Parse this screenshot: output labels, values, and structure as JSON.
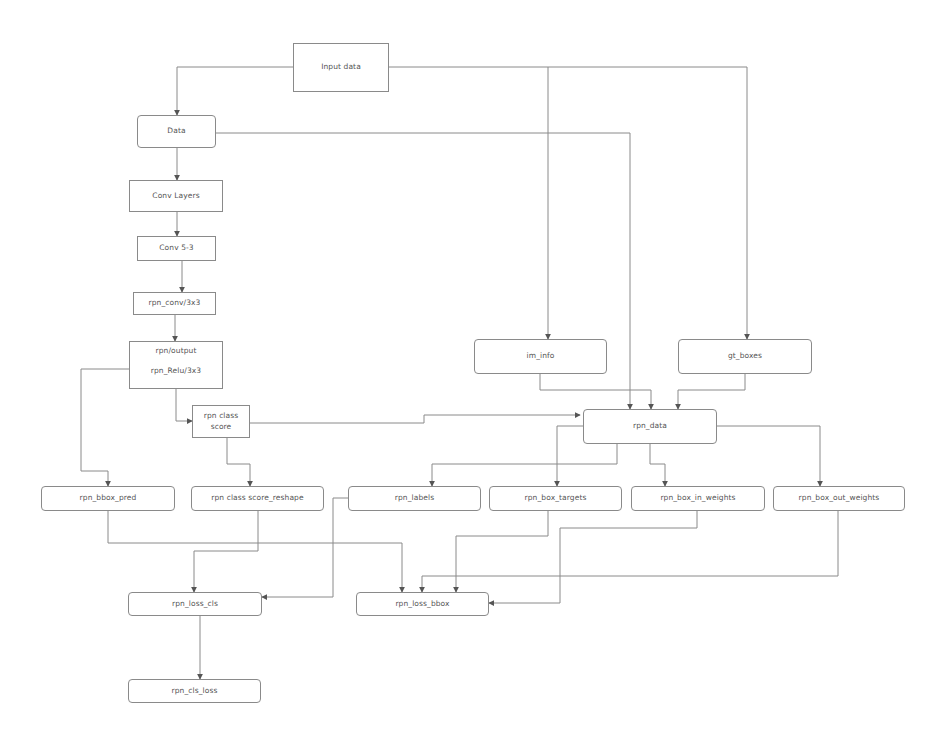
{
  "diagram": {
    "type": "flowchart",
    "colors": {
      "line": "#8a8a8a",
      "text": "#555555",
      "background": "#ffffff"
    },
    "nodes": {
      "input_data": {
        "label": "Input data",
        "shape": "rectangle"
      },
      "data": {
        "label": "Data",
        "shape": "rounded"
      },
      "conv_layers": {
        "label": "Conv Layers",
        "shape": "rectangle"
      },
      "conv5_3": {
        "label": "Conv 5-3",
        "shape": "rectangle"
      },
      "rpn_conv": {
        "label": "rpn_conv/3x3",
        "shape": "rectangle"
      },
      "rpn_output": {
        "label_top": "rpn/output",
        "label_bottom": "rpn_Relu/3x3",
        "shape": "rectangle"
      },
      "rpn_class_score": {
        "label_top": "rpn class",
        "label_bottom": "score",
        "shape": "rectangle"
      },
      "im_info": {
        "label": "im_info",
        "shape": "rounded"
      },
      "gt_boxes": {
        "label": "gt_boxes",
        "shape": "rounded"
      },
      "rpn_data": {
        "label": "rpn_data",
        "shape": "rounded"
      },
      "rpn_bbox_pred": {
        "label": "rpn_bbox_pred",
        "shape": "rounded"
      },
      "rpn_class_score_reshape": {
        "label": "rpn class score_reshape",
        "shape": "rounded"
      },
      "rpn_labels": {
        "label": "rpn_labels",
        "shape": "rounded"
      },
      "rpn_box_targets": {
        "label": "rpn_box_targets",
        "shape": "rounded"
      },
      "rpn_box_in_weights": {
        "label": "rpn_box_in_weights",
        "shape": "rounded"
      },
      "rpn_box_out_weights": {
        "label": "rpn_box_out_weights",
        "shape": "rounded"
      },
      "rpn_loss_cls": {
        "label": "rpn_loss_cls",
        "shape": "rounded"
      },
      "rpn_loss_bbox": {
        "label": "rpn_loss_bbox",
        "shape": "rounded"
      },
      "rpn_cls_loss": {
        "label": "rpn_cls_loss",
        "shape": "rounded"
      }
    },
    "edges": [
      {
        "from": "input_data",
        "to": "data"
      },
      {
        "from": "input_data",
        "to": "im_info"
      },
      {
        "from": "input_data",
        "to": "gt_boxes"
      },
      {
        "from": "data",
        "to": "conv_layers"
      },
      {
        "from": "data",
        "to": "rpn_data"
      },
      {
        "from": "conv_layers",
        "to": "conv5_3"
      },
      {
        "from": "conv5_3",
        "to": "rpn_conv"
      },
      {
        "from": "rpn_conv",
        "to": "rpn_output"
      },
      {
        "from": "rpn_output",
        "to": "rpn_class_score"
      },
      {
        "from": "rpn_output",
        "to": "rpn_bbox_pred"
      },
      {
        "from": "rpn_class_score",
        "to": "rpn_data"
      },
      {
        "from": "rpn_class_score",
        "to": "rpn_class_score_reshape"
      },
      {
        "from": "im_info",
        "to": "rpn_data"
      },
      {
        "from": "gt_boxes",
        "to": "rpn_data"
      },
      {
        "from": "rpn_data",
        "to": "rpn_labels"
      },
      {
        "from": "rpn_data",
        "to": "rpn_box_targets"
      },
      {
        "from": "rpn_data",
        "to": "rpn_box_in_weights"
      },
      {
        "from": "rpn_data",
        "to": "rpn_box_out_weights"
      },
      {
        "from": "rpn_bbox_pred",
        "to": "rpn_loss_bbox"
      },
      {
        "from": "rpn_class_score_reshape",
        "to": "rpn_loss_cls"
      },
      {
        "from": "rpn_labels",
        "to": "rpn_loss_cls"
      },
      {
        "from": "rpn_box_targets",
        "to": "rpn_loss_bbox"
      },
      {
        "from": "rpn_box_in_weights",
        "to": "rpn_loss_bbox"
      },
      {
        "from": "rpn_box_out_weights",
        "to": "rpn_loss_bbox"
      },
      {
        "from": "rpn_loss_cls",
        "to": "rpn_cls_loss"
      }
    ]
  }
}
